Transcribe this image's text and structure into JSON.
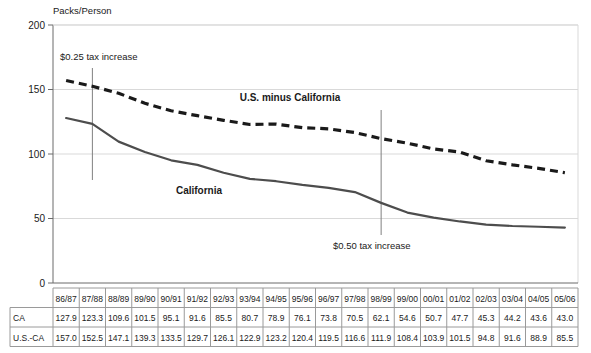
{
  "chart_data": {
    "type": "line",
    "title": "",
    "ylabel": "Packs/Person",
    "xlabel": "",
    "ylim": [
      0,
      200
    ],
    "yticks": [
      0,
      50,
      100,
      150,
      200
    ],
    "grid": true,
    "legend_position": "inline-labels",
    "categories": [
      "86/87",
      "87/88",
      "88/89",
      "89/90",
      "90/91",
      "91/92",
      "92/93",
      "93/94",
      "94/95",
      "95/96",
      "96/97",
      "97/98",
      "98/99",
      "99/00",
      "00/01",
      "01/02",
      "02/03",
      "03/04",
      "04/05",
      "05/06"
    ],
    "series": [
      {
        "name": "California",
        "style": "solid",
        "color": "#4d4d4d",
        "values": [
          127.9,
          123.3,
          109.6,
          101.5,
          95.1,
          91.6,
          85.5,
          80.7,
          78.9,
          76.1,
          73.8,
          70.5,
          62.1,
          54.6,
          50.7,
          47.7,
          45.3,
          44.2,
          43.6,
          43.0
        ]
      },
      {
        "name": "U.S. minus California",
        "style": "dashed",
        "color": "#1a1a1a",
        "values": [
          157.0,
          152.5,
          147.1,
          139.3,
          133.5,
          129.7,
          126.1,
          122.9,
          123.2,
          120.4,
          119.5,
          116.6,
          111.9,
          108.4,
          103.9,
          101.5,
          94.8,
          91.6,
          88.9,
          85.5
        ]
      }
    ],
    "annotations": [
      {
        "text": "$0.25 tax increase",
        "at_category": "87/88",
        "label_x": 60,
        "label_y": 60,
        "line_top": 68,
        "line_bottom": 180
      },
      {
        "text": "$0.50 tax increase",
        "at_category": "98/99",
        "label_x": 333,
        "label_y": 249,
        "line_top": 110,
        "line_bottom": 235
      }
    ],
    "series_label_positions": [
      {
        "name": "U.S. minus California",
        "x": 290,
        "y": 101
      },
      {
        "name": "California",
        "x": 199,
        "y": 194
      }
    ]
  },
  "table": {
    "row_labels": [
      "CA",
      "U.S.-CA"
    ],
    "header": [
      "86/87",
      "87/88",
      "88/89",
      "89/90",
      "90/91",
      "91/92",
      "92/93",
      "93/94",
      "94/95",
      "95/96",
      "96/97",
      "97/98",
      "98/99",
      "99/00",
      "00/01",
      "01/02",
      "02/03",
      "03/04",
      "04/05",
      "05/06"
    ],
    "rows": [
      [
        "127.9",
        "123.3",
        "109.6",
        "101.5",
        "95.1",
        "91.6",
        "85.5",
        "80.7",
        "78.9",
        "76.1",
        "73.8",
        "70.5",
        "62.1",
        "54.6",
        "50.7",
        "47.7",
        "45.3",
        "44.2",
        "43.6",
        "43.0"
      ],
      [
        "157.0",
        "152.5",
        "147.1",
        "139.3",
        "133.5",
        "129.7",
        "126.1",
        "122.9",
        "123.2",
        "120.4",
        "119.5",
        "116.6",
        "111.9",
        "108.4",
        "103.9",
        "101.5",
        "94.8",
        "91.6",
        "88.9",
        "85.5"
      ]
    ]
  },
  "colors": {
    "axis": "#6b6b6b",
    "grid": "#d9d9d9",
    "california_line": "#4d4d4d",
    "us_minus_ca_line": "#1a1a1a",
    "annotation_line": "#808080",
    "table_border": "#9a9a9a",
    "text": "#1a1a1a"
  }
}
